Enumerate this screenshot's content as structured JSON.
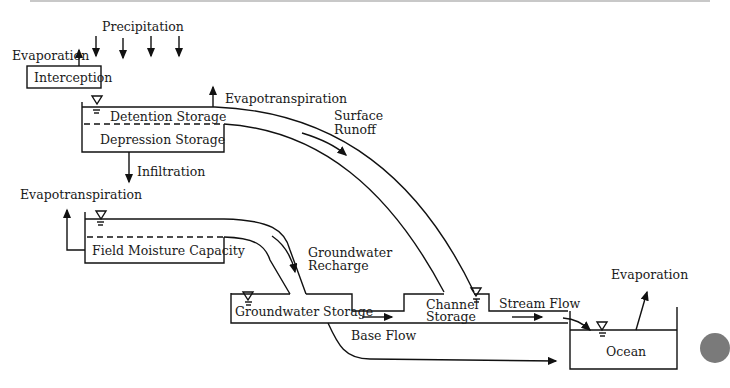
{
  "diagram": {
    "labels": {
      "precipitation": "Precipitation",
      "evaporation_top": "Evaporation",
      "interception": "Interception",
      "evapotranspiration_top": "Evapotranspiration",
      "detention_storage": "Detention Storage",
      "depression_storage": "Depression Storage",
      "infiltration": "Infiltration",
      "surface_runoff_1": "Surface",
      "surface_runoff_2": "Runoff",
      "evapotranspiration_left": "Evapotranspiration",
      "field_moisture_capacity": "Field Moisture Capacity",
      "groundwater_recharge_1": "Groundwater",
      "groundwater_recharge_2": "Recharge",
      "groundwater_storage": "Groundwater Storage",
      "channel_storage_1": "Channel",
      "channel_storage_2": "Storage",
      "stream_flow": "Stream Flow",
      "base_flow": "Base Flow",
      "evaporation_ocean": "Evaporation",
      "ocean": "Ocean"
    },
    "colors": {
      "line": "#111111",
      "background": "#ffffff"
    }
  }
}
